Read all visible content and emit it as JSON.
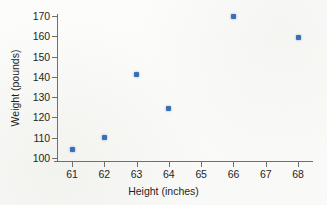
{
  "chart_data": {
    "type": "scatter",
    "title": "",
    "xlabel": "Height (inches)",
    "ylabel": "Weight (pounds)",
    "x": [
      61,
      62,
      63,
      64,
      66,
      68
    ],
    "values": [
      104,
      110,
      141,
      124.5,
      170,
      159.5
    ],
    "points": [
      {
        "x": 61,
        "y": 104
      },
      {
        "x": 62,
        "y": 110
      },
      {
        "x": 63,
        "y": 141
      },
      {
        "x": 64,
        "y": 124.5
      },
      {
        "x": 66,
        "y": 170
      },
      {
        "x": 68,
        "y": 159.5
      }
    ],
    "xlim": [
      60.4,
      68.6
    ],
    "ylim": [
      97.5,
      173.5
    ],
    "x_ticks": [
      61,
      62,
      63,
      64,
      65,
      66,
      67,
      68
    ],
    "y_ticks": [
      100,
      110,
      120,
      130,
      140,
      150,
      160,
      170
    ],
    "x_tick_labels": [
      "61",
      "62",
      "63",
      "64",
      "65",
      "66",
      "67",
      "68"
    ],
    "y_tick_labels": [
      "100",
      "110",
      "120",
      "130",
      "140",
      "150",
      "160",
      "170"
    ],
    "grid": false,
    "legend": false,
    "legend_position": "none",
    "marker_color": "#3b6fb5",
    "axis_color": "#6f6f6f",
    "background_color": "#fbfbfa"
  }
}
